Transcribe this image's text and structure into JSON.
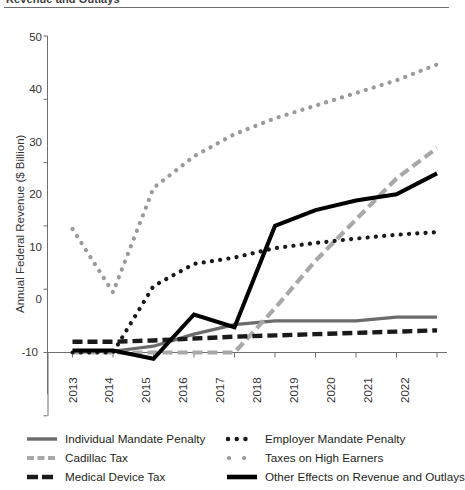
{
  "figure": {
    "title": "Revenue and Outlays",
    "title_clipped": true
  },
  "axes": {
    "ylabel": "Annual Federal Revenue ($ Billion)",
    "yticks": [
      "50",
      "40",
      "30",
      "20",
      "10",
      "0",
      "-10"
    ],
    "xticks": [
      "2013",
      "2014",
      "2015",
      "2016",
      "2017",
      "2018",
      "2019",
      "2020",
      "2021",
      "2022"
    ]
  },
  "legend": {
    "left": [
      {
        "label": "Individual Mandate Penalty",
        "style": "solid",
        "color": "#6b6b6b",
        "width": 3
      },
      {
        "label": "Cadillac Tax",
        "style": "dashed",
        "color": "#a8a8a8",
        "width": 4
      },
      {
        "label": "Medical Device Tax",
        "style": "dashed",
        "color": "#1a1a1a",
        "width": 4
      }
    ],
    "right": [
      {
        "label": "Employer Mandate Penalty",
        "style": "dotted",
        "color": "#1a1a1a",
        "width": 4
      },
      {
        "label": "Taxes on High Earners",
        "style": "dotted",
        "color": "#9a9a9a",
        "width": 4
      },
      {
        "label": "Other Effects on Revenue and Outlays",
        "style": "solid",
        "color": "#000000",
        "width": 4
      }
    ]
  },
  "chart_data": {
    "type": "line",
    "title": "Revenue and Outlays",
    "xlabel": "",
    "ylabel": "Annual Federal Revenue ($ Billion)",
    "x": [
      2013,
      2014,
      2015,
      2016,
      2017,
      2018,
      2019,
      2020,
      2021,
      2022
    ],
    "ylim": [
      -10,
      50
    ],
    "xlim": [
      2013,
      2022
    ],
    "grid": false,
    "legend_position": "bottom",
    "series": [
      {
        "name": "Individual Mandate Penalty",
        "color": "#6b6b6b",
        "style": "solid",
        "values": [
          0.0,
          0.2,
          1.0,
          2.9,
          4.4,
          5.0,
          5.0,
          5.0,
          5.6,
          5.6
        ]
      },
      {
        "name": "Cadillac Tax",
        "color": "#a8a8a8",
        "style": "dashed",
        "values": [
          0.0,
          0.0,
          0.0,
          0.0,
          0.0,
          7.0,
          14.5,
          21.0,
          27.5,
          32.3
        ]
      },
      {
        "name": "Medical Device Tax",
        "color": "#1a1a1a",
        "style": "dashed",
        "values": [
          1.7,
          1.7,
          1.9,
          2.2,
          2.5,
          2.7,
          2.9,
          3.1,
          3.3,
          3.5
        ]
      },
      {
        "name": "Employer Mandate Penalty",
        "color": "#1a1a1a",
        "style": "dotted",
        "values": [
          0.0,
          0.0,
          10.5,
          14.0,
          15.0,
          16.5,
          17.3,
          18.0,
          18.6,
          19.0
        ]
      },
      {
        "name": "Taxes on High Earners",
        "color": "#9a9a9a",
        "style": "dotted",
        "values": [
          19.5,
          9.5,
          26.0,
          31.0,
          34.5,
          37.0,
          39.0,
          41.0,
          43.0,
          45.5
        ]
      },
      {
        "name": "Other Effects on Revenue and Outlays",
        "color": "#000000",
        "style": "solid",
        "values": [
          0.3,
          0.3,
          -1.0,
          6.0,
          4.0,
          20.0,
          22.5,
          24.0,
          25.0,
          28.3
        ]
      }
    ]
  }
}
